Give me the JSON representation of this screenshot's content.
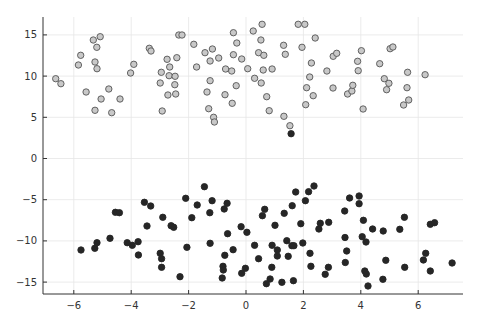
{
  "chart_data": {
    "type": "scatter",
    "title": "",
    "xlabel": "",
    "ylabel": "",
    "xlim": [
      -7.1,
      7.5
    ],
    "ylim": [
      -16.3,
      17.0
    ],
    "xticks": [
      -6,
      -4,
      -2,
      0,
      2,
      4,
      6
    ],
    "xtick_labels": [
      "−6",
      "−4",
      "−2",
      "0",
      "2",
      "4",
      "6"
    ],
    "yticks": [
      -15,
      -10,
      -5,
      0,
      5,
      10,
      15
    ],
    "ytick_labels": [
      "−15",
      "−10",
      "−5",
      "0",
      "5",
      "10",
      "15"
    ],
    "grid": true,
    "legend": "none",
    "series": [
      {
        "name": "light",
        "marker_fill": "#c8c8c8",
        "marker_stroke": "#555555",
        "points": [
          [
            -6.63,
            9.68
          ],
          [
            -6.45,
            9.08
          ],
          [
            -5.84,
            11.35
          ],
          [
            -5.76,
            12.52
          ],
          [
            -5.32,
            14.38
          ],
          [
            -5.08,
            14.78
          ],
          [
            -5.2,
            13.5
          ],
          [
            -5.26,
            11.71
          ],
          [
            -5.19,
            10.9
          ],
          [
            -5.57,
            8.07
          ],
          [
            -4.78,
            8.43
          ],
          [
            -5.05,
            7.22
          ],
          [
            -4.39,
            7.22
          ],
          [
            -5.26,
            5.85
          ],
          [
            -4.68,
            5.56
          ],
          [
            -3.91,
            11.43
          ],
          [
            -4.02,
            10.38
          ],
          [
            -3.37,
            13.37
          ],
          [
            -3.31,
            13.05
          ],
          [
            -2.34,
            14.99
          ],
          [
            -2.23,
            14.99
          ],
          [
            -1.82,
            13.86
          ],
          [
            -2.75,
            12.04
          ],
          [
            -2.41,
            12.23
          ],
          [
            -2.66,
            11.1
          ],
          [
            -2.95,
            10.46
          ],
          [
            -2.68,
            10.05
          ],
          [
            -2.47,
            9.98
          ],
          [
            -2.99,
            9.16
          ],
          [
            -2.48,
            8.96
          ],
          [
            -2.72,
            7.71
          ],
          [
            -2.45,
            7.83
          ],
          [
            -2.92,
            5.76
          ],
          [
            -1.72,
            11.1
          ],
          [
            -1.43,
            12.84
          ],
          [
            -1.17,
            13.29
          ],
          [
            -1.25,
            11.83
          ],
          [
            -0.95,
            12.2
          ],
          [
            -1.25,
            9.44
          ],
          [
            -1.36,
            8.07
          ],
          [
            -1.3,
            6.04
          ],
          [
            -1.13,
            5.0
          ],
          [
            -1.1,
            4.43
          ],
          [
            -0.44,
            15.27
          ],
          [
            -0.32,
            14.02
          ],
          [
            -0.44,
            12.6
          ],
          [
            -0.15,
            12.08
          ],
          [
            -0.71,
            10.86
          ],
          [
            -0.5,
            10.62
          ],
          [
            0.06,
            10.9
          ],
          [
            -0.34,
            8.83
          ],
          [
            -0.73,
            7.74
          ],
          [
            -0.48,
            6.7
          ],
          [
            0.25,
            15.47
          ],
          [
            0.56,
            16.29
          ],
          [
            0.52,
            14.38
          ],
          [
            0.44,
            12.84
          ],
          [
            0.62,
            12.52
          ],
          [
            0.6,
            10.74
          ],
          [
            0.91,
            10.86
          ],
          [
            0.3,
            9.73
          ],
          [
            0.53,
            9.16
          ],
          [
            0.72,
            7.5
          ],
          [
            0.81,
            5.8
          ],
          [
            1.31,
            13.74
          ],
          [
            1.37,
            12.65
          ],
          [
            1.82,
            16.29
          ],
          [
            2.05,
            16.29
          ],
          [
            1.95,
            13.5
          ],
          [
            2.41,
            14.62
          ],
          [
            2.28,
            11.59
          ],
          [
            2.22,
            9.89
          ],
          [
            2.11,
            8.59
          ],
          [
            2.34,
            7.62
          ],
          [
            2.08,
            6.53
          ],
          [
            1.32,
            5.12
          ],
          [
            1.53,
            3.98
          ],
          [
            2.82,
            10.62
          ],
          [
            3.04,
            12.4
          ],
          [
            3.16,
            12.77
          ],
          [
            3.03,
            8.56
          ],
          [
            3.54,
            7.83
          ],
          [
            3.69,
            8.19
          ],
          [
            3.72,
            8.88
          ],
          [
            4.02,
            13.08
          ],
          [
            3.89,
            11.8
          ],
          [
            3.91,
            10.66
          ],
          [
            4.08,
            6.01
          ],
          [
            4.66,
            11.5
          ],
          [
            5.02,
            13.33
          ],
          [
            5.12,
            13.53
          ],
          [
            4.82,
            9.68
          ],
          [
            4.98,
            9.13
          ],
          [
            4.9,
            8.35
          ],
          [
            5.63,
            10.46
          ],
          [
            5.61,
            8.59
          ],
          [
            5.67,
            7.1
          ],
          [
            5.49,
            6.49
          ],
          [
            6.24,
            10.17
          ]
        ]
      },
      {
        "name": "dark",
        "marker_fill": "#262626",
        "marker_stroke": "#262626",
        "points": [
          [
            -5.75,
            -11.1
          ],
          [
            -5.27,
            -10.9
          ],
          [
            -5.19,
            -10.22
          ],
          [
            -4.74,
            -9.68
          ],
          [
            -4.55,
            -6.53
          ],
          [
            -4.41,
            -6.58
          ],
          [
            -4.14,
            -10.22
          ],
          [
            -3.96,
            -10.53
          ],
          [
            -3.76,
            -10.1
          ],
          [
            -3.75,
            -11.71
          ],
          [
            -3.54,
            -5.31
          ],
          [
            -3.32,
            -5.76
          ],
          [
            -3.45,
            -8.19
          ],
          [
            -2.9,
            -7.14
          ],
          [
            -2.61,
            -8.16
          ],
          [
            -2.52,
            -8.35
          ],
          [
            -2.99,
            -11.5
          ],
          [
            -2.94,
            -12.16
          ],
          [
            -2.94,
            -13.2
          ],
          [
            -2.3,
            -14.34
          ],
          [
            -2.1,
            -4.83
          ],
          [
            -2.06,
            -10.78
          ],
          [
            -1.89,
            -7.18
          ],
          [
            -1.7,
            -5.64
          ],
          [
            -1.45,
            -3.42
          ],
          [
            -1.18,
            -5.12
          ],
          [
            -1.26,
            -6.58
          ],
          [
            -1.25,
            -10.29
          ],
          [
            -0.66,
            -5.44
          ],
          [
            -0.76,
            -6.13
          ],
          [
            -0.64,
            -9.13
          ],
          [
            -0.45,
            -11.07
          ],
          [
            -0.74,
            -11.75
          ],
          [
            -0.8,
            -13.08
          ],
          [
            -0.79,
            -13.53
          ],
          [
            -0.83,
            -14.5
          ],
          [
            -0.17,
            -8.28
          ],
          [
            0.03,
            -8.96
          ],
          [
            -0.15,
            -13.93
          ],
          [
            -0.02,
            -13.33
          ],
          [
            0.3,
            -10.53
          ],
          [
            0.44,
            -12.16
          ],
          [
            0.65,
            -6.17
          ],
          [
            0.57,
            -6.94
          ],
          [
            1.01,
            -8.11
          ],
          [
            0.91,
            -10.53
          ],
          [
            1.09,
            -11.1
          ],
          [
            1.09,
            -11.83
          ],
          [
            0.9,
            -13.2
          ],
          [
            0.84,
            -14.62
          ],
          [
            0.71,
            -15.19
          ],
          [
            1.25,
            -15.02
          ],
          [
            1.33,
            -6.65
          ],
          [
            1.61,
            -5.73
          ],
          [
            1.73,
            -4.07
          ],
          [
            1.42,
            -9.98
          ],
          [
            1.6,
            -10.58
          ],
          [
            1.67,
            -10.58
          ],
          [
            1.47,
            -11.87
          ],
          [
            1.65,
            -14.83
          ],
          [
            1.91,
            -7.91
          ],
          [
            1.98,
            -10.25
          ],
          [
            2.07,
            -5.12
          ],
          [
            2.18,
            -4.03
          ],
          [
            2.37,
            -3.34
          ],
          [
            2.23,
            -11.5
          ],
          [
            2.26,
            -13.08
          ],
          [
            2.54,
            -8.56
          ],
          [
            2.59,
            -7.86
          ],
          [
            2.88,
            -7.74
          ],
          [
            2.87,
            -13.2
          ],
          [
            2.76,
            -14.05
          ],
          [
            3.44,
            -6.37
          ],
          [
            3.45,
            -9.59
          ],
          [
            3.51,
            -11.23
          ],
          [
            3.46,
            -12.62
          ],
          [
            3.61,
            -4.79
          ],
          [
            3.94,
            -4.55
          ],
          [
            3.94,
            -5.49
          ],
          [
            4.09,
            -7.5
          ],
          [
            4.41,
            -8.56
          ],
          [
            4.78,
            -8.8
          ],
          [
            4.05,
            -9.49
          ],
          [
            4.18,
            -10.13
          ],
          [
            4.87,
            -12.35
          ],
          [
            4.19,
            -14.02
          ],
          [
            4.14,
            -13.65
          ],
          [
            4.25,
            -15.47
          ],
          [
            4.77,
            -14.66
          ],
          [
            5.52,
            -7.14
          ],
          [
            5.36,
            -8.59
          ],
          [
            5.53,
            -13.2
          ],
          [
            6.42,
            -7.99
          ],
          [
            6.57,
            -7.79
          ],
          [
            6.26,
            -11.5
          ],
          [
            6.18,
            -12.32
          ],
          [
            6.42,
            -13.65
          ],
          [
            7.18,
            -12.68
          ],
          [
            1.57,
            3.01
          ]
        ]
      }
    ]
  },
  "layout": {
    "width": 484,
    "height": 323,
    "plot_left": 43,
    "plot_right": 463,
    "plot_top": 17,
    "plot_bottom": 294,
    "x_zero_px": 246,
    "x_px_per_unit": 28.7,
    "y_zero_px": 158.5,
    "y_px_per_unit": 8.24,
    "marker_radius": 3.2,
    "grid_color": "#e6e6e6",
    "axis_color": "#333333"
  }
}
